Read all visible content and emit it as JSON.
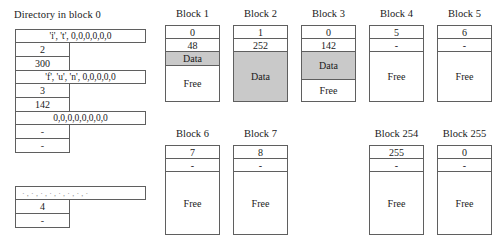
{
  "directory": {
    "title": "Directory in block 0",
    "entries": [
      {
        "name": "'i', 't', 0,0,0,0,0,0",
        "start": "2",
        "size": "300",
        "faded": false
      },
      {
        "name": "'f', 'u', 'n', 0,0,0,0,0",
        "start": "3",
        "size": "142",
        "faded": false
      },
      {
        "name": "0,0,0,0,0,0,0,0",
        "start": "-",
        "size": "-",
        "faded": false
      }
    ],
    "trailing_entries": [
      {
        "name": "·,·,·,·,·,·,·,·",
        "start": "4",
        "size": "-",
        "faded": true
      }
    ]
  },
  "blocks_row_1": [
    {
      "label": "Block 1",
      "next": "0",
      "size": "48",
      "segments": [
        {
          "kind": "data",
          "label": "Data",
          "height": 14
        },
        {
          "kind": "free",
          "label": "Free",
          "height": 35
        }
      ]
    },
    {
      "label": "Block 2",
      "next": "1",
      "size": "252",
      "segments": [
        {
          "kind": "data",
          "label": "Data",
          "height": 49
        }
      ]
    },
    {
      "label": "Block 3",
      "next": "0",
      "size": "142",
      "segments": [
        {
          "kind": "data",
          "label": "Data",
          "height": 28
        },
        {
          "kind": "free",
          "label": "Free",
          "height": 21
        }
      ]
    },
    {
      "label": "Block 4",
      "next": "5",
      "size": "-",
      "segments": [
        {
          "kind": "free",
          "label": "Free",
          "height": 49
        }
      ]
    },
    {
      "label": "Block 5",
      "next": "6",
      "size": "-",
      "segments": [
        {
          "kind": "free",
          "label": "Free",
          "height": 49
        }
      ]
    }
  ],
  "blocks_row_2": [
    {
      "label": "Block 6",
      "next": "7",
      "size": "-",
      "segments": [
        {
          "kind": "free",
          "label": "Free",
          "height": 62
        }
      ]
    },
    {
      "label": "Block 7",
      "next": "8",
      "size": "-",
      "segments": [
        {
          "kind": "free",
          "label": "Free",
          "height": 62
        }
      ]
    },
    {
      "label": "Block 254",
      "next": "255",
      "size": "-",
      "segments": [
        {
          "kind": "free",
          "label": "Free",
          "height": 62
        }
      ]
    },
    {
      "label": "Block 255",
      "next": "0",
      "size": "-",
      "segments": [
        {
          "kind": "free",
          "label": "Free",
          "height": 62
        }
      ]
    }
  ],
  "colors": {
    "data_fill": "#c9c9c9",
    "border": "#5f5f5f",
    "background": "#ffffff",
    "text": "#1a1a1a"
  }
}
